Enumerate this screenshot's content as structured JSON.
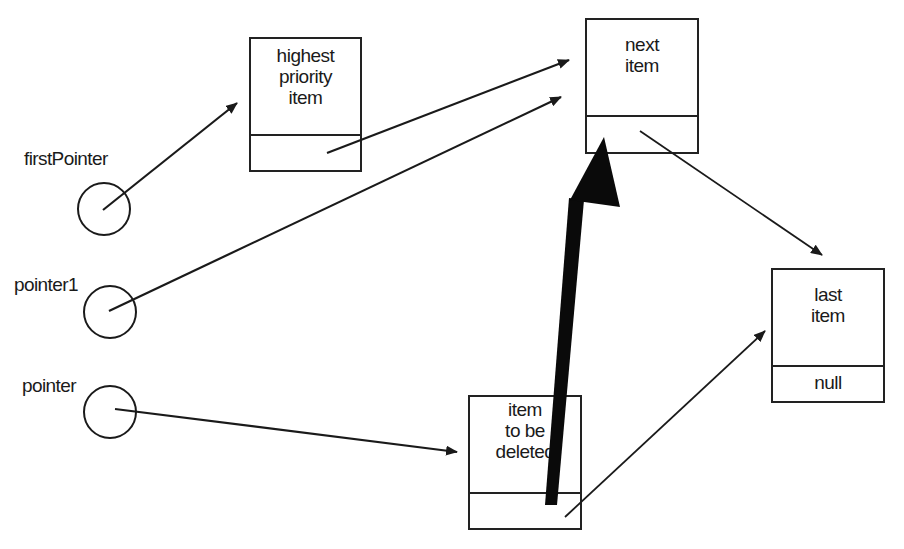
{
  "diagram": {
    "type": "linked-list-deletion",
    "pointers": [
      {
        "id": "firstPointer",
        "label": "firstPointer"
      },
      {
        "id": "pointer1",
        "label": "pointer1"
      },
      {
        "id": "pointer",
        "label": "pointer"
      }
    ],
    "nodes": [
      {
        "id": "highest",
        "lines": [
          "highest",
          "priority",
          "item"
        ],
        "link": ""
      },
      {
        "id": "next",
        "lines": [
          "next",
          "item"
        ],
        "link": ""
      },
      {
        "id": "last",
        "lines": [
          "last",
          "item"
        ],
        "link": "null"
      },
      {
        "id": "deleted",
        "lines": [
          "item",
          "to be",
          "deleted"
        ],
        "link": ""
      }
    ],
    "edges": [
      {
        "from": "firstPointer",
        "to": "highest",
        "style": "thin"
      },
      {
        "from": "highest",
        "to": "next",
        "style": "thin"
      },
      {
        "from": "pointer1",
        "to": "next",
        "style": "thin"
      },
      {
        "from": "pointer",
        "to": "deleted",
        "style": "thin"
      },
      {
        "from": "next",
        "to": "last",
        "style": "thin"
      },
      {
        "from": "deleted",
        "to": "last",
        "style": "thin"
      },
      {
        "from": "deleted",
        "to": "next",
        "style": "thick"
      }
    ],
    "colors": {
      "stroke": "#1a1a1a",
      "background": "#ffffff"
    }
  }
}
